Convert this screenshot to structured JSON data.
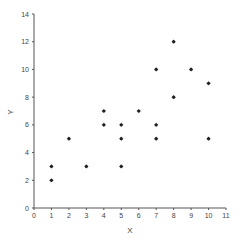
{
  "chart_data": {
    "type": "scatter",
    "title": "",
    "xlabel": "X",
    "ylabel": "Y",
    "xlim": [
      0,
      11
    ],
    "ylim": [
      0,
      14
    ],
    "x_ticks": [
      0,
      1,
      2,
      3,
      4,
      5,
      6,
      7,
      8,
      9,
      10,
      11
    ],
    "y_ticks": [
      0,
      2,
      4,
      6,
      8,
      10,
      12,
      14
    ],
    "grid": false,
    "legend": null,
    "marker_color": "#222222",
    "axis_color": "#555555",
    "points": [
      {
        "x": 1,
        "y": 3
      },
      {
        "x": 1,
        "y": 2
      },
      {
        "x": 2,
        "y": 5
      },
      {
        "x": 3,
        "y": 3
      },
      {
        "x": 4,
        "y": 7
      },
      {
        "x": 4,
        "y": 6
      },
      {
        "x": 5,
        "y": 6
      },
      {
        "x": 5,
        "y": 5
      },
      {
        "x": 5,
        "y": 3
      },
      {
        "x": 6,
        "y": 7
      },
      {
        "x": 7,
        "y": 10
      },
      {
        "x": 7,
        "y": 6
      },
      {
        "x": 7,
        "y": 5
      },
      {
        "x": 8,
        "y": 12
      },
      {
        "x": 8,
        "y": 8
      },
      {
        "x": 9,
        "y": 10
      },
      {
        "x": 10,
        "y": 9
      },
      {
        "x": 10,
        "y": 5
      }
    ]
  }
}
